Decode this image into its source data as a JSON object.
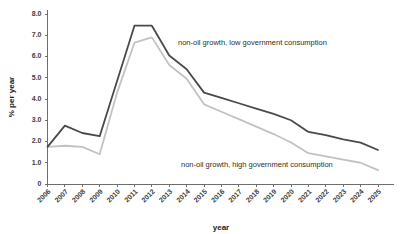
{
  "chart_data": {
    "type": "line",
    "title": "",
    "subtitle": "",
    "xlabel": "year",
    "ylabel": "% per year",
    "grid": false,
    "legend_position": "inline-annotation",
    "x": [
      2006,
      2007,
      2008,
      2009,
      2010,
      2011,
      2012,
      2013,
      2014,
      2015,
      2016,
      2017,
      2018,
      2019,
      2020,
      2021,
      2022,
      2023,
      2024,
      2025
    ],
    "xtick_labels": [
      "2006",
      "2007",
      "2008",
      "2009",
      "2010",
      "2011",
      "2012",
      "2013",
      "2014",
      "2015",
      "2016",
      "2017",
      "2018",
      "2019",
      "2020",
      "2021",
      "2022",
      "2023",
      "2024",
      "2025"
    ],
    "ytick_labels": [
      "0",
      "1.0",
      "2.0",
      "3.0",
      "4.0",
      "5.0",
      "6.0",
      "7.0",
      "8.0"
    ],
    "ytick_values": [
      0,
      1,
      2,
      3,
      4,
      5,
      6,
      7,
      8
    ],
    "ylim": [
      0,
      8
    ],
    "xlim": [
      2006,
      2025
    ],
    "series": [
      {
        "name": "non-oil growth, low government consumption",
        "color": "#4a4a4a",
        "width": 1.8,
        "values": [
          1.75,
          2.75,
          2.4,
          2.25,
          4.85,
          7.45,
          7.45,
          6.05,
          5.4,
          4.3,
          4.05,
          3.8,
          3.55,
          3.3,
          3.0,
          2.45,
          2.3,
          2.1,
          1.95,
          1.6
        ]
      },
      {
        "name": "non-oil growth, high government consumption",
        "color": "#c2c2c2",
        "width": 1.8,
        "values": [
          1.75,
          1.8,
          1.75,
          1.4,
          4.3,
          6.65,
          6.9,
          5.6,
          4.95,
          3.75,
          3.4,
          3.05,
          2.7,
          2.35,
          1.95,
          1.45,
          1.3,
          1.15,
          1.0,
          0.65
        ]
      }
    ],
    "annotations": [
      {
        "id": "label-low-gov",
        "text": "non-oil growth, low government consumption",
        "x_px": 178,
        "y_px": 45
      },
      {
        "id": "label-high-gov",
        "text": "non-oil growth, high government consumption",
        "x_px": 181,
        "y_px": 167
      }
    ]
  },
  "axes": {
    "y_axis_title": "% per year",
    "x_axis_title": "year"
  }
}
